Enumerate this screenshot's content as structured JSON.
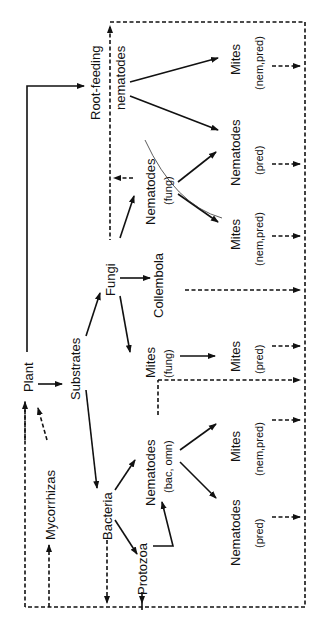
{
  "diagram": {
    "orientation": "rotated 90° counter-clockwise",
    "nodes": {
      "plant": {
        "label": "Plant"
      },
      "mycorrhizas": {
        "label": "Mycorrhizas"
      },
      "substrates": {
        "label": "Substrates"
      },
      "fungi": {
        "label": "Fungi"
      },
      "bacteria": {
        "label": "Bacteria"
      },
      "protozoa": {
        "label": "Protozoa"
      },
      "root_feeding_nematodes": {
        "label_line1": "Root-feeding",
        "label_line2": "nematodes"
      },
      "nematodes_fung": {
        "label": "Nematodes",
        "qualifier": "(fung)"
      },
      "collembola": {
        "label": "Collembola"
      },
      "mites_fung": {
        "label": "Mites",
        "qualifier": "(fung)"
      },
      "nematodes_bac_omn": {
        "label": "Nematodes",
        "qualifier": "(bac, omn)"
      },
      "mites_nem_pred_top": {
        "label": "Mites",
        "qualifier": "(nem,pred)"
      },
      "nematodes_pred_top": {
        "label": "Nematodes",
        "qualifier": "(pred)"
      },
      "mites_nem_pred_mid": {
        "label": "Mites",
        "qualifier": "(nem,pred)"
      },
      "mites_pred": {
        "label": "Mites",
        "qualifier": "(pred)"
      },
      "mites_nem_pred_low": {
        "label": "Mites",
        "qualifier": "(nem,pred)"
      },
      "nematodes_pred_low": {
        "label": "Nematodes",
        "qualifier": "(pred)"
      }
    },
    "legend": {
      "solid_arrow": "feeding / energy flow",
      "dashed_arrow": "return to substrates (detritus)"
    },
    "colors": {
      "ink": "#111111",
      "background": "#ffffff"
    }
  }
}
